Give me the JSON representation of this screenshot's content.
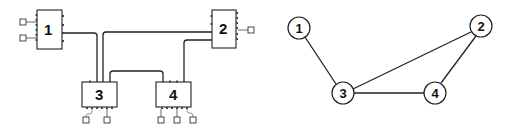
{
  "left_diagram": {
    "title": "Physical wiring layout",
    "modules": [
      {
        "id": "1",
        "label": "1"
      },
      {
        "id": "2",
        "label": "2"
      },
      {
        "id": "3",
        "label": "3"
      },
      {
        "id": "4",
        "label": "4"
      }
    ],
    "connections": [
      {
        "from": "1",
        "to": "3"
      },
      {
        "from": "2",
        "to": "3"
      },
      {
        "from": "2",
        "to": "4"
      },
      {
        "from": "3",
        "to": "4"
      }
    ],
    "terminals": {
      "1": 2,
      "2": 1,
      "3": 2,
      "4": 3
    }
  },
  "right_diagram": {
    "title": "Graph representation",
    "nodes": [
      {
        "id": "1",
        "label": "1"
      },
      {
        "id": "2",
        "label": "2"
      },
      {
        "id": "3",
        "label": "3"
      },
      {
        "id": "4",
        "label": "4"
      }
    ],
    "edges": [
      {
        "from": "1",
        "to": "3"
      },
      {
        "from": "2",
        "to": "3"
      },
      {
        "from": "2",
        "to": "4"
      },
      {
        "from": "3",
        "to": "4"
      }
    ]
  },
  "colors": {
    "stroke": "#222222",
    "background": "#ffffff"
  }
}
